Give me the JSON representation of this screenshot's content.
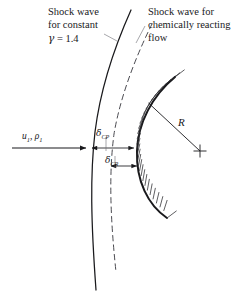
{
  "figure": {
    "title_left_line1": "Shock wave",
    "title_left_line2": "for constant",
    "gamma_symbol": "γ",
    "gamma_value": "= 1.4",
    "title_right_line1": "Shock wave for",
    "title_right_line2": "chemically reacting",
    "title_right_line3": "flow",
    "radius_label": "R",
    "flow_label_u": "u",
    "flow_label_u_sub": "1",
    "flow_label_sep": ", ",
    "flow_label_rho": "ρ",
    "flow_label_rho_sub": "1",
    "delta_cp_symbol": "δ",
    "delta_cp_sub": "CP",
    "delta_cr_symbol": "δ",
    "delta_cr_sub": "CR",
    "colors": {
      "ink": "#19191c",
      "background": "#ffffff",
      "hatch": "#2a2a2e"
    }
  }
}
